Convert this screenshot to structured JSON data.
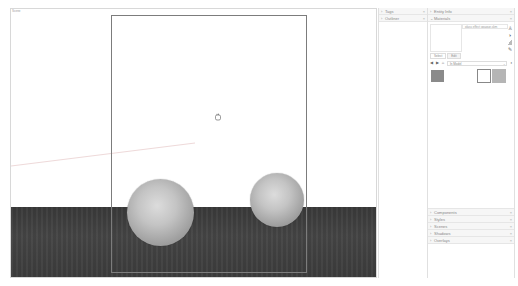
{
  "viewport": {
    "scene_label": "Scene",
    "background": "#ffffff",
    "ground_color": "#3f3f3f",
    "sphere_color": "#c8c8c8"
  },
  "tray_left": {
    "panels": [
      {
        "label": "Tags",
        "expanded": false
      },
      {
        "label": "Outliner",
        "expanded": false
      }
    ]
  },
  "tray_right": {
    "entity_info": {
      "label": "Entity Info",
      "expanded": false
    },
    "materials": {
      "label": "Materials",
      "expanded": true,
      "material_name": "glass effect opaque.skm",
      "tabs": [
        {
          "label": "Select",
          "active": true
        },
        {
          "label": "Edit",
          "active": false
        }
      ],
      "collection": "In Model",
      "swatches": [
        {
          "color": "#8a8a8a",
          "selected": false
        },
        {
          "color": "#ffffff",
          "selected": true
        },
        {
          "color": "#b5b5b5",
          "selected": false
        }
      ],
      "side_icons": [
        "paint-bucket-icon",
        "create-material-icon",
        "default-material-icon",
        "sample-paint-icon"
      ]
    },
    "lower_panels": [
      {
        "label": "Components"
      },
      {
        "label": "Styles"
      },
      {
        "label": "Scenes"
      },
      {
        "label": "Shadows"
      },
      {
        "label": "Overlays"
      }
    ]
  },
  "icons": {
    "chevron_right": "›",
    "chevron_down": "⌄",
    "close": "×",
    "plus": "+",
    "back": "◀",
    "forward": "▶",
    "home": "⌂",
    "details": "◑",
    "paint_bucket": "♙",
    "pencil": "✎"
  }
}
